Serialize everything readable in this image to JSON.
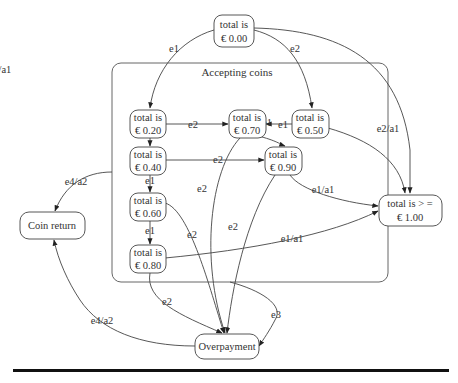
{
  "diagram": {
    "type": "state-machine",
    "cluster": {
      "label": "Accepting coins"
    },
    "nodes": {
      "s000": {
        "line1": "total is",
        "line2": "€ 0.00"
      },
      "s020": {
        "line1": "total is",
        "line2": "€ 0.20"
      },
      "s070": {
        "line1": "total is",
        "line2": "€ 0.70"
      },
      "s050": {
        "line1": "total is",
        "line2": "€ 0.50"
      },
      "s040": {
        "line1": "total is",
        "line2": "€ 0.40"
      },
      "s090": {
        "line1": "total is",
        "line2": "€ 0.90"
      },
      "s060": {
        "line1": "total is",
        "line2": "€ 0.60"
      },
      "s080": {
        "line1": "total is",
        "line2": "€ 0.80"
      },
      "s100": {
        "line1": "total is > =",
        "line2": "€ 1.00"
      },
      "coin_return": {
        "line1": "Coin return"
      },
      "overpayment": {
        "line1": "Overpayment"
      }
    },
    "edges": [
      {
        "from": "total is € 0.00",
        "to": "total is € 0.20",
        "label": "e1"
      },
      {
        "from": "total is € 0.00",
        "to": "total is € 0.50",
        "label": "e2"
      },
      {
        "from": "total is € 0.00",
        "to": "total is > = € 1.00",
        "label": "e3/a1"
      },
      {
        "from": "total is € 0.20",
        "to": "total is € 0.70",
        "label": "e2"
      },
      {
        "from": "total is € 0.50",
        "to": "total is € 0.70",
        "label": "e1"
      },
      {
        "from": "total is € 0.50",
        "to": "total is > = € 1.00",
        "label": "e2/a1"
      },
      {
        "from": "total is € 0.20",
        "to": "total is € 0.40",
        "label": "e1"
      },
      {
        "from": "total is € 0.70",
        "to": "total is € 0.90",
        "label": "e1"
      },
      {
        "from": "total is € 0.70",
        "to": "Overpayment",
        "label": "e2"
      },
      {
        "from": "total is € 0.40",
        "to": "total is € 0.90",
        "label": "e2"
      },
      {
        "from": "total is € 0.40",
        "to": "total is € 0.60",
        "label": "e1"
      },
      {
        "from": "total is € 0.90",
        "to": "total is > = € 1.00",
        "label": "e1/a1"
      },
      {
        "from": "total is € 0.90",
        "to": "Overpayment",
        "label": "e2"
      },
      {
        "from": "total is € 0.60",
        "to": "total is € 0.80",
        "label": "e1"
      },
      {
        "from": "total is € 0.60",
        "to": "Overpayment",
        "label": "e2"
      },
      {
        "from": "total is € 0.80",
        "to": "total is > = € 1.00",
        "label": "e1/a1"
      },
      {
        "from": "total is € 0.80",
        "to": "Overpayment",
        "label": "e2"
      },
      {
        "from": "Accepting coins",
        "to": "Coin return",
        "label": "e4/a2"
      },
      {
        "from": "Accepting coins",
        "to": "Overpayment",
        "label": "e3"
      },
      {
        "from": "Overpayment",
        "to": "Coin return",
        "label": "e4/a2"
      }
    ],
    "labels": {
      "e000_020": "e1",
      "e000_050": "e2",
      "e000_100": "e3/a1",
      "e020_070": "e2",
      "e050_070": "e1",
      "e050_100": "e2/a1",
      "e020_040": "e1",
      "e070_090": "e1",
      "e070_over": "e2",
      "e040_090": "e2",
      "e040_060": "e1",
      "e090_100": "e1/a1",
      "e090_over": "e2",
      "e060_080": "e1",
      "e060_over": "e2",
      "e080_100": "e1/a1",
      "e080_over": "e2",
      "ecl_coin": "e4/a2",
      "ecl_over": "e3",
      "eover_coin": "e4/a2"
    }
  }
}
